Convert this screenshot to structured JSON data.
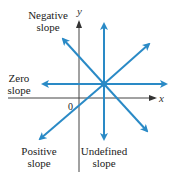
{
  "diagram": {
    "axes": {
      "x_label": "x",
      "y_label": "y",
      "origin_label": "0"
    },
    "labels": {
      "negative": [
        "Negative",
        "slope"
      ],
      "zero": [
        "Zero",
        "slope"
      ],
      "positive": [
        "Positive",
        "slope"
      ],
      "undefined": [
        "Undefined",
        "slope"
      ]
    },
    "colors": {
      "line": "#2a8ac6",
      "axis": "#444444"
    }
  }
}
